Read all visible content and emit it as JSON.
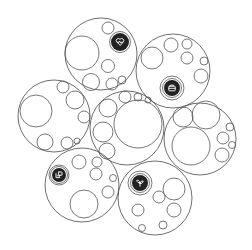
{
  "diagram": {
    "type": "circle-packing",
    "width": 252,
    "height": 250,
    "stroke_color": "#555555",
    "badge_color": "#222222",
    "clusters": [
      {
        "id": "top",
        "icon": "heart-pulse-icon",
        "outer": {
          "cx": 101,
          "cy": 54,
          "r": 36
        },
        "badge": {
          "cx": 120,
          "cy": 42,
          "r": 9
        },
        "children": [
          {
            "cx": 82,
            "cy": 53,
            "r": 17
          },
          {
            "cx": 108,
            "cy": 28,
            "r": 6
          },
          {
            "cx": 108,
            "cy": 66,
            "r": 6.5
          },
          {
            "cx": 91,
            "cy": 82,
            "r": 8.5
          },
          {
            "cx": 112,
            "cy": 84,
            "r": 6
          },
          {
            "cx": 122,
            "cy": 80,
            "r": 4
          }
        ]
      },
      {
        "id": "top-right",
        "icon": "briefcase-icon",
        "outer": {
          "cx": 173,
          "cy": 71,
          "r": 37
        },
        "badge": {
          "cx": 172,
          "cy": 88,
          "r": 8
        },
        "ring": {
          "cx": 172,
          "cy": 88,
          "r": 12
        },
        "children": [
          {
            "cx": 152,
            "cy": 58,
            "r": 11
          },
          {
            "cx": 171,
            "cy": 45,
            "r": 7
          },
          {
            "cx": 187,
            "cy": 44,
            "r": 5
          },
          {
            "cx": 187,
            "cy": 58,
            "r": 6
          },
          {
            "cx": 204,
            "cy": 61,
            "r": 4
          },
          {
            "cx": 201,
            "cy": 76,
            "r": 7
          }
        ]
      },
      {
        "id": "left",
        "icon": null,
        "outer": {
          "cx": 54,
          "cy": 116,
          "r": 36
        },
        "children": [
          {
            "cx": 36,
            "cy": 111,
            "r": 16
          },
          {
            "cx": 63,
            "cy": 87,
            "r": 6
          },
          {
            "cx": 75,
            "cy": 100,
            "r": 9
          },
          {
            "cx": 84,
            "cy": 117,
            "r": 6
          },
          {
            "cx": 45,
            "cy": 142,
            "r": 8
          },
          {
            "cx": 67,
            "cy": 143,
            "r": 6
          },
          {
            "cx": 77,
            "cy": 141,
            "r": 3
          }
        ]
      },
      {
        "id": "center",
        "icon": null,
        "outer": {
          "cx": 127,
          "cy": 128,
          "r": 37
        },
        "children": [
          {
            "cx": 138,
            "cy": 124,
            "r": 24
          },
          {
            "cx": 108,
            "cy": 108,
            "r": 9
          },
          {
            "cx": 125,
            "cy": 97,
            "r": 6
          },
          {
            "cx": 138,
            "cy": 97,
            "r": 4
          },
          {
            "cx": 148,
            "cy": 100,
            "r": 3
          },
          {
            "cx": 103,
            "cy": 132,
            "r": 10
          },
          {
            "cx": 107,
            "cy": 151,
            "r": 8
          }
        ]
      },
      {
        "id": "right",
        "icon": null,
        "outer": {
          "cx": 200,
          "cy": 139,
          "r": 36
        },
        "children": [
          {
            "cx": 183,
            "cy": 117,
            "r": 10
          },
          {
            "cx": 206,
            "cy": 115,
            "r": 14
          },
          {
            "cx": 191,
            "cy": 146,
            "r": 19
          },
          {
            "cx": 223,
            "cy": 138,
            "r": 6
          },
          {
            "cx": 230,
            "cy": 127,
            "r": 4
          },
          {
            "cx": 232,
            "cy": 145,
            "r": 3.5
          },
          {
            "cx": 222,
            "cy": 155,
            "r": 7
          }
        ]
      },
      {
        "id": "bottom-left",
        "icon": "chat-screen-icon",
        "outer": {
          "cx": 82,
          "cy": 185,
          "r": 37
        },
        "badge": {
          "cx": 59,
          "cy": 175,
          "r": 7
        },
        "ring": {
          "cx": 59,
          "cy": 175,
          "r": 10
        },
        "children": [
          {
            "cx": 79,
            "cy": 162,
            "r": 7
          },
          {
            "cx": 97,
            "cy": 162,
            "r": 5
          },
          {
            "cx": 96,
            "cy": 174,
            "r": 6
          },
          {
            "cx": 113,
            "cy": 178,
            "r": 3.5
          },
          {
            "cx": 84,
            "cy": 204,
            "r": 14
          },
          {
            "cx": 108,
            "cy": 192,
            "r": 6
          }
        ]
      },
      {
        "id": "bottom-right",
        "icon": "sprout-icon",
        "outer": {
          "cx": 155,
          "cy": 198,
          "r": 37
        },
        "badge": {
          "cx": 140,
          "cy": 183,
          "r": 8
        },
        "ring": {
          "cx": 140,
          "cy": 183,
          "r": 12
        },
        "children": [
          {
            "cx": 174,
            "cy": 189,
            "r": 11
          },
          {
            "cx": 159,
            "cy": 197,
            "r": 6
          },
          {
            "cx": 138,
            "cy": 210,
            "r": 6
          },
          {
            "cx": 174,
            "cy": 210,
            "r": 7
          },
          {
            "cx": 142,
            "cy": 228,
            "r": 3.5
          },
          {
            "cx": 163,
            "cy": 225,
            "r": 4
          }
        ]
      }
    ]
  }
}
